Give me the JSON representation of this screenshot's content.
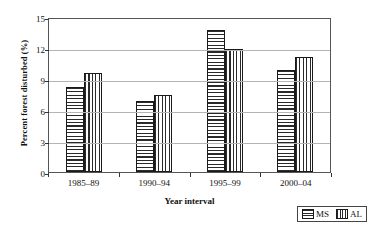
{
  "chart_data": {
    "type": "bar",
    "title": "",
    "xlabel": "Year interval",
    "ylabel": "Percent forest disturbed (%)",
    "categories": [
      "1985–89",
      "1990–94",
      "1995–99",
      "2000–04"
    ],
    "series": [
      {
        "name": "MS",
        "values": [
          8.2,
          6.9,
          13.7,
          9.9
        ],
        "pattern": "horizontal-hatch"
      },
      {
        "name": "AL",
        "values": [
          9.6,
          7.5,
          11.9,
          11.1
        ],
        "pattern": "vertical-hatch"
      }
    ],
    "ylim": [
      0,
      15
    ],
    "yticks": [
      0,
      3,
      6,
      9,
      12,
      15
    ],
    "grid": true,
    "legend_position": "bottom-right",
    "colors": {
      "line": "#1a1a1a",
      "grid": "#b4b4b4",
      "frame": "#555555",
      "background": "#ffffff"
    }
  },
  "legend": {
    "entries": [
      {
        "label": "MS"
      },
      {
        "label": "AL"
      }
    ]
  }
}
